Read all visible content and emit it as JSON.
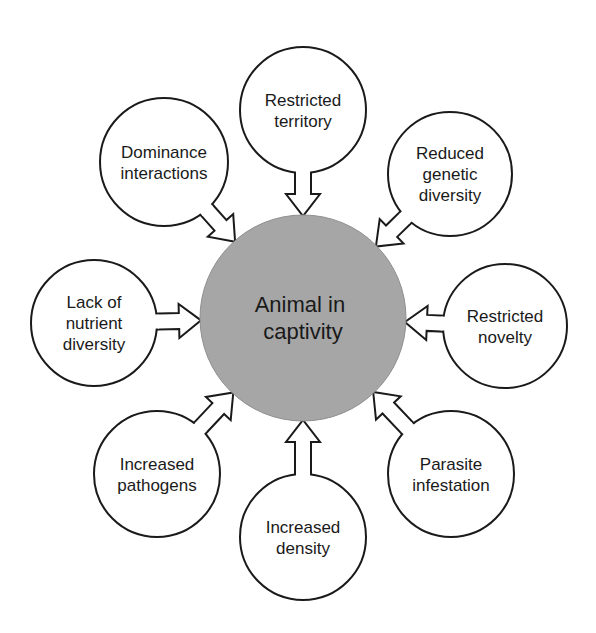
{
  "diagram": {
    "type": "hub-and-spoke",
    "center": {
      "lines": [
        "Animal in",
        "captivity"
      ],
      "cx": 303,
      "cy": 318,
      "r": 103,
      "fill": "#a6a6a6"
    },
    "nodes": [
      {
        "id": "restricted-territory",
        "lines": [
          "Restricted",
          "territory"
        ],
        "cx": 303,
        "cy": 110,
        "r": 63
      },
      {
        "id": "reduced-genetic-diversity",
        "lines": [
          "Reduced",
          "genetic",
          "diversity"
        ],
        "cx": 450,
        "cy": 174,
        "r": 62
      },
      {
        "id": "restricted-novelty",
        "lines": [
          "Restricted",
          "novelty"
        ],
        "cx": 505,
        "cy": 326,
        "r": 62
      },
      {
        "id": "parasite-infestation",
        "lines": [
          "Parasite",
          "infestation"
        ],
        "cx": 451,
        "cy": 474,
        "r": 63
      },
      {
        "id": "increased-density",
        "lines": [
          "Increased",
          "density"
        ],
        "cx": 303,
        "cy": 537,
        "r": 63
      },
      {
        "id": "increased-pathogens",
        "lines": [
          "Increased",
          "pathogens"
        ],
        "cx": 157,
        "cy": 474,
        "r": 63
      },
      {
        "id": "lack-of-nutrient-diversity",
        "lines": [
          "Lack of",
          "nutrient",
          "diversity"
        ],
        "cx": 94,
        "cy": 323,
        "r": 63
      },
      {
        "id": "dominance-interactions",
        "lines": [
          "Dominance",
          "interactions"
        ],
        "cx": 164,
        "cy": 162,
        "r": 64
      }
    ],
    "edges_direction": "all outer nodes point inward to center",
    "colors": {
      "stroke": "#1a1a1a",
      "center_fill": "#a6a6a6",
      "background": "#ffffff"
    }
  }
}
